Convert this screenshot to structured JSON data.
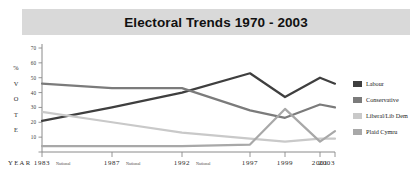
{
  "title": "Electoral Trends 1970 - 2003",
  "axis": {
    "y_label_chars": [
      "%",
      "V",
      "O",
      "T",
      "E"
    ],
    "y_label_text": "% VOTE",
    "x_label": "YEAR",
    "y_ticks": [
      70,
      60,
      50,
      40,
      30,
      20,
      10
    ],
    "x_tick_labels": [
      "1983",
      "1987",
      "1992",
      "1997",
      "1999",
      "2001",
      "2003"
    ],
    "x_tick_sublabels": [
      "National",
      "National",
      "National",
      "",
      "",
      "",
      ""
    ]
  },
  "legend": {
    "items": [
      {
        "label": "Labour",
        "color": "#3f3f3f"
      },
      {
        "label": "Conservative",
        "color": "#7b7b7b"
      },
      {
        "label": "Liberal/Lib Dem",
        "color": "#c9c9c9"
      },
      {
        "label": "Plaid Cymru",
        "color": "#a8a8a8"
      }
    ]
  },
  "chart_data": {
    "type": "line",
    "title": "Electoral Trends 1970 - 2003",
    "xlabel": "YEAR",
    "ylabel": "% VOTE",
    "x": [
      "1983",
      "1987",
      "1992",
      "1997",
      "1999",
      "2001",
      "2003"
    ],
    "ylim": [
      0,
      70
    ],
    "yticks": [
      10,
      20,
      30,
      40,
      50,
      60,
      70
    ],
    "grid": false,
    "legend_position": "right",
    "series": [
      {
        "name": "Labour",
        "color": "#3f3f3f",
        "values": [
          21,
          30,
          40,
          53,
          37,
          50,
          46
        ]
      },
      {
        "name": "Conservative",
        "color": "#7b7b7b",
        "values": [
          46,
          43,
          43,
          28,
          23,
          32,
          30
        ]
      },
      {
        "name": "Liberal/Lib Dem",
        "color": "#c9c9c9",
        "values": [
          27,
          20,
          13,
          9,
          7,
          9,
          9
        ]
      },
      {
        "name": "Plaid Cymru",
        "color": "#a8a8a8",
        "values": [
          4,
          4,
          4,
          5,
          29,
          7,
          14
        ]
      }
    ]
  }
}
